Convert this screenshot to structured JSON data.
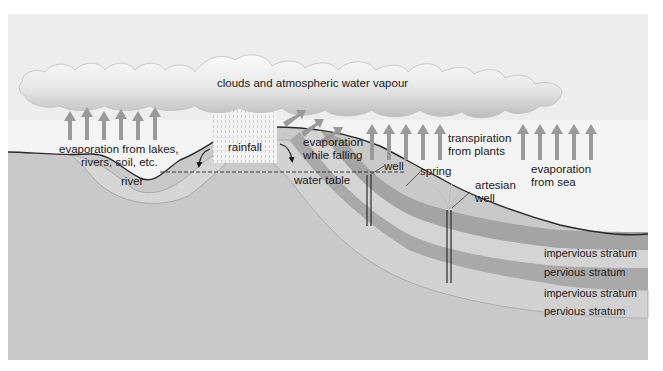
{
  "labels": {
    "clouds": "clouds and atmospheric water vapour",
    "evap_lakes_line1": "evaporation from lakes,",
    "evap_lakes_line2": "rivers, soil, etc.",
    "rainfall": "rainfall",
    "evap_falling_line1": "evaporation",
    "evap_falling_line2": "while falling",
    "transpiration_line1": "transpiration",
    "transpiration_line2": "from plants",
    "evap_sea_line1": "evaporation",
    "evap_sea_line2": "from sea",
    "river": "river",
    "water_table": "water table",
    "well": "well",
    "spring": "spring",
    "artesian_line1": "artesian",
    "artesian_line2": "well",
    "strata": [
      "impervious stratum",
      "pervious stratum",
      "impervious stratum",
      "pervious stratum"
    ]
  },
  "colors": {
    "background_sky": "#ededed",
    "cloud_top": "#fafafa",
    "cloud_bottom": "#c4c4c4",
    "arrow": "#9a9a9a",
    "ground": "#c9c9c9",
    "impervious": "#a8a8a8",
    "pervious": "#d4d4d4",
    "sea": "#dcdcdc",
    "line": "#2a2a2a"
  }
}
